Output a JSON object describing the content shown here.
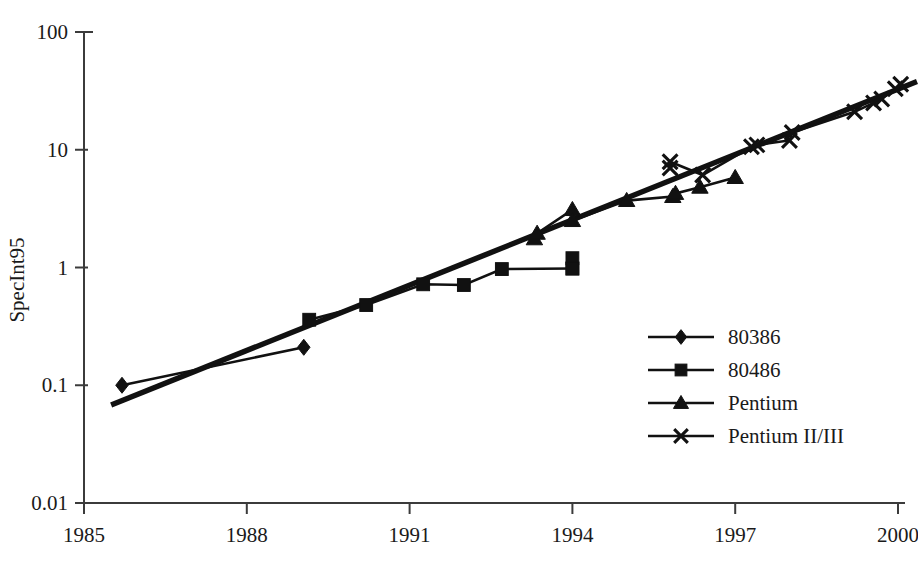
{
  "chart_data": {
    "type": "line",
    "title": "",
    "xlabel": "",
    "ylabel": "SpecInt95",
    "xlim": [
      1985,
      2000.6
    ],
    "ylim": [
      0.01,
      100
    ],
    "yscale": "log",
    "xscale": "linear",
    "grid": false,
    "xticks": [
      1985,
      1988,
      1991,
      1994,
      1997,
      2000
    ],
    "xticklabels": [
      "1985",
      "1988",
      "1991",
      "1994",
      "1997",
      "2000"
    ],
    "yticks": [
      0.01,
      0.1,
      1,
      10,
      100
    ],
    "yticklabels": [
      "0.01",
      "0.1",
      "1",
      "10",
      "100"
    ],
    "legend_position": "center-right",
    "series": [
      {
        "name": "80386",
        "marker": "diamond",
        "points": [
          {
            "x": 1985.7,
            "y": 0.1
          },
          {
            "x": 1989.05,
            "y": 0.21
          }
        ]
      },
      {
        "name": "80486",
        "marker": "square",
        "points": [
          {
            "x": 1989.15,
            "y": 0.36
          },
          {
            "x": 1990.2,
            "y": 0.48
          },
          {
            "x": 1991.25,
            "y": 0.72
          },
          {
            "x": 1992.0,
            "y": 0.71
          },
          {
            "x": 1992.7,
            "y": 0.97
          },
          {
            "x": 1994.0,
            "y": 0.98
          }
        ]
      },
      {
        "name": "80486-extra",
        "marker": "square",
        "points": [
          {
            "x": 1994.0,
            "y": 1.2
          },
          {
            "x": 1994.0,
            "y": 0.98
          }
        ]
      },
      {
        "name": "Pentium",
        "marker": "triangle",
        "points": [
          {
            "x": 1993.3,
            "y": 1.75
          },
          {
            "x": 1993.35,
            "y": 1.95
          },
          {
            "x": 1994.0,
            "y": 3.1
          },
          {
            "x": 1994.0,
            "y": 2.5
          },
          {
            "x": 1995.0,
            "y": 3.7
          },
          {
            "x": 1995.85,
            "y": 4.0
          },
          {
            "x": 1995.9,
            "y": 4.25
          },
          {
            "x": 1996.35,
            "y": 4.8
          },
          {
            "x": 1997.0,
            "y": 5.8
          }
        ]
      },
      {
        "name": "Pentium II/III",
        "marker": "x",
        "points": [
          {
            "x": 1995.8,
            "y": 7.0
          },
          {
            "x": 1995.8,
            "y": 7.9
          },
          {
            "x": 1996.4,
            "y": 6.1
          },
          {
            "x": 1997.3,
            "y": 10.6
          },
          {
            "x": 1997.4,
            "y": 11.0
          },
          {
            "x": 1998.0,
            "y": 12.0
          },
          {
            "x": 1998.05,
            "y": 14.0
          },
          {
            "x": 1999.2,
            "y": 21.0
          },
          {
            "x": 1999.55,
            "y": 25.0
          },
          {
            "x": 1999.7,
            "y": 27.0
          },
          {
            "x": 1999.95,
            "y": 33.0
          },
          {
            "x": 2000.05,
            "y": 36.0
          }
        ]
      }
    ],
    "trend_line": {
      "name": "exponential-trend",
      "points": [
        {
          "x": 1985.5,
          "y": 0.068
        },
        {
          "x": 2000.35,
          "y": 38.0
        }
      ]
    },
    "legend_entries": [
      {
        "label": "80386",
        "marker": "diamond"
      },
      {
        "label": "80486",
        "marker": "square"
      },
      {
        "label": "Pentium",
        "marker": "triangle"
      },
      {
        "label": "Pentium II/III",
        "marker": "x"
      }
    ]
  }
}
